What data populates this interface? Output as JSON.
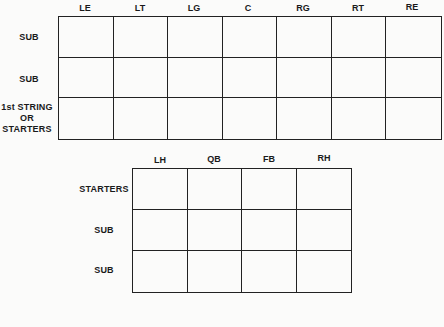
{
  "line_chart": {
    "columns": [
      "LE",
      "LT",
      "LG",
      "C",
      "RG",
      "RT",
      "RE"
    ],
    "rows": [
      "SUB",
      "SUB",
      "1st STRING OR STARTERS"
    ],
    "row_lines": [
      [
        "SUB"
      ],
      [
        "SUB"
      ],
      [
        "1st STRING",
        "OR",
        "STARTERS"
      ]
    ]
  },
  "backfield_chart": {
    "columns": [
      "LH",
      "QB",
      "FB",
      "RH"
    ],
    "rows": [
      "STARTERS",
      "SUB",
      "SUB"
    ]
  },
  "colors": {
    "line": "#222222",
    "background": "#fbfbfa"
  }
}
